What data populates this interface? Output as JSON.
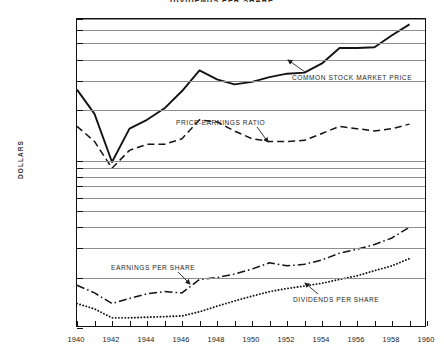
{
  "chart": {
    "title": "DIVIDENDS PER SHARE",
    "ylabel": "DOLLARS"
  },
  "annotations": {
    "stock": "COMMON STOCK MARKET PRICE",
    "pe": "PRICE-EARNINGS RATIO",
    "eps": "EARNINGS PER SHARE",
    "div": "DIVIDENDS PER SHARE"
  },
  "axis": {
    "y_ticks": [
      "70.00",
      "60.00",
      "50.00",
      "40.00",
      "30.00",
      "20.00",
      "10.00",
      "9.00",
      "8.00",
      "7.00",
      "6.00",
      "5.00",
      "4.00",
      "3.00",
      "2.00",
      "1.00"
    ],
    "x_ticks": [
      "1940",
      "1942",
      "1944",
      "1946",
      "1948",
      "1950",
      "1952",
      "1954",
      "1956",
      "1958",
      "1960"
    ]
  },
  "chart_data": {
    "type": "line",
    "title": "DIVIDENDS PER SHARE",
    "xlabel": "",
    "ylabel": "DOLLARS",
    "yscale": "log",
    "ylim": [
      1.0,
      70.0
    ],
    "xlim": [
      1940,
      1960
    ],
    "grid": true,
    "legend": "inline-annotations",
    "ytick_values": [
      70,
      60,
      50,
      40,
      30,
      20,
      10,
      9,
      8,
      7,
      6,
      5,
      4,
      3,
      2,
      1
    ],
    "xtick_values": [
      1940,
      1942,
      1944,
      1946,
      1948,
      1950,
      1952,
      1954,
      1956,
      1958,
      1960
    ],
    "x": [
      1940,
      1941,
      1942,
      1943,
      1944,
      1945,
      1946,
      1947,
      1948,
      1949,
      1950,
      1951,
      1952,
      1953,
      1954,
      1955,
      1956,
      1957,
      1958,
      1959
    ],
    "series": [
      {
        "name": "COMMON STOCK MARKET PRICE",
        "style": "solid",
        "values": [
          26.5,
          19.0,
          9.8,
          15.5,
          17.5,
          20.5,
          26.0,
          34.5,
          30.5,
          28.5,
          29.5,
          31.5,
          33.0,
          33.5,
          38.0,
          47.0,
          47.0,
          47.5,
          56.0,
          65.0
        ]
      },
      {
        "name": "PRICE-EARNINGS RATIO",
        "style": "dashed",
        "values": [
          16.0,
          13.0,
          9.0,
          11.5,
          12.5,
          12.5,
          13.5,
          17.5,
          17.0,
          15.0,
          13.5,
          13.0,
          13.0,
          13.2,
          14.5,
          16.0,
          15.5,
          15.0,
          15.5,
          16.5
        ]
      },
      {
        "name": "EARNINGS PER SHARE",
        "style": "dash-dot",
        "values": [
          1.8,
          1.62,
          1.4,
          1.5,
          1.6,
          1.65,
          1.62,
          1.95,
          2.0,
          2.1,
          2.25,
          2.45,
          2.35,
          2.4,
          2.55,
          2.8,
          2.95,
          3.15,
          3.45,
          4.0
        ]
      },
      {
        "name": "DIVIDENDS PER SHARE",
        "style": "dotted",
        "values": [
          1.4,
          1.3,
          1.15,
          1.15,
          1.16,
          1.17,
          1.18,
          1.25,
          1.35,
          1.45,
          1.55,
          1.65,
          1.72,
          1.78,
          1.85,
          1.95,
          2.05,
          2.2,
          2.35,
          2.6
        ]
      }
    ]
  }
}
